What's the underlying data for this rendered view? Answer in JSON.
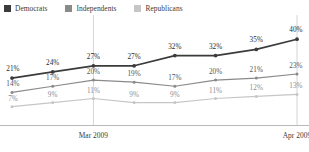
{
  "chart_data": {
    "type": "line",
    "title": "",
    "subtitle": "",
    "xlabel": "",
    "ylabel": "",
    "grid": "vertical gridlines at Mar 2009 and Apr 2009",
    "legend_position": "top-left",
    "ylim": [
      0,
      45
    ],
    "x": [
      1,
      2,
      3,
      4,
      5,
      6,
      7,
      8
    ],
    "categories": [
      "",
      "",
      "Mar 2009",
      "",
      "",
      "",
      "",
      "Apr 2009"
    ],
    "tick_labels": [
      "Mar 2009",
      "Apr 2009"
    ],
    "series": [
      {
        "name": "Democrats",
        "color": "#3b3b3b",
        "values": [
          21,
          24,
          27,
          27,
          32,
          32,
          35,
          40
        ],
        "labels": [
          "21%",
          "24%",
          "27%",
          "27%",
          "32%",
          "32%",
          "35%",
          "40%"
        ]
      },
      {
        "name": "Independents",
        "color": "#8a8a8a",
        "values": [
          14,
          17,
          20,
          19,
          17,
          20,
          21,
          23
        ],
        "labels": [
          "14%",
          "17%",
          "20%",
          "19%",
          "17%",
          "20%",
          "21%",
          "23%"
        ]
      },
      {
        "name": "Republicans",
        "color": "#c6c6c6",
        "values": [
          7,
          9,
          11,
          9,
          9,
          11,
          12,
          13
        ],
        "labels": [
          "7%",
          "9%",
          "11%",
          "9%",
          "9%",
          "11%",
          "12%",
          "13%"
        ]
      }
    ]
  },
  "legend": {
    "items": [
      {
        "label": "Democrats",
        "color": "#3b3b3b"
      },
      {
        "label": "Independents",
        "color": "#8a8a8a"
      },
      {
        "label": "Republicans",
        "color": "#c6c6c6"
      }
    ]
  },
  "axis": {
    "tick_1": "Mar 2009",
    "tick_2": "Apr 2009"
  },
  "colors": {
    "democrats": "#3b3b3b",
    "independents": "#8a8a8a",
    "republicans": "#c6c6c6",
    "gridline": "#c9c9c9",
    "axis": "#b9b9b9",
    "background": "#ffffff"
  }
}
